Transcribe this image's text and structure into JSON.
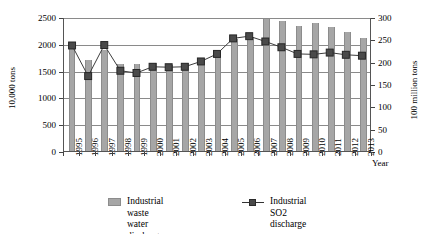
{
  "chart_data": {
    "type": "bar",
    "title": "",
    "xlabel": "Year",
    "ylabel": "10,000 tons",
    "ylabel_secondary": "100 million tons",
    "grid": true,
    "legend_position": "bottom",
    "categories": [
      "1995",
      "1996",
      "1997",
      "1998",
      "1999",
      "2000",
      "2001",
      "2002",
      "2003",
      "2004",
      "2005",
      "2006",
      "2007",
      "2008",
      "2009",
      "2010",
      "2011",
      "2012",
      "2013"
    ],
    "ylim": [
      0,
      2500
    ],
    "ylim_secondary": [
      0,
      300
    ],
    "yticks": [
      "0",
      "500",
      "1000",
      "1500",
      "2000",
      "2500"
    ],
    "yticks_secondary": [
      "0",
      "50",
      "100",
      "150",
      "200",
      "250",
      "300"
    ],
    "series": [
      {
        "name": "Industrial waste water discharge",
        "axis": "left",
        "unit": "10,000 tons",
        "render": "bar",
        "values": [
          1990,
          1690,
          1890,
          1630,
          1620,
          1650,
          1610,
          1640,
          1720,
          1870,
          2090,
          2130,
          2470,
          2420,
          2340,
          2380,
          2310,
          2220,
          2100
        ]
      },
      {
        "name": "Industrial SO2 discharge",
        "axis": "right",
        "unit": "100 million tons",
        "render": "line",
        "values": [
          238,
          169,
          239,
          181,
          176,
          190,
          189,
          190,
          202,
          219,
          254,
          259,
          247,
          234,
          219,
          218,
          222,
          217,
          215
        ]
      }
    ]
  },
  "legend": {
    "bar_label": "Industrial waste water discharge",
    "line_label": "Industrial SO2 discharge"
  },
  "axes": {
    "left_title": "10,000 tons",
    "right_title": "100 million tons",
    "x_title": "Year"
  }
}
